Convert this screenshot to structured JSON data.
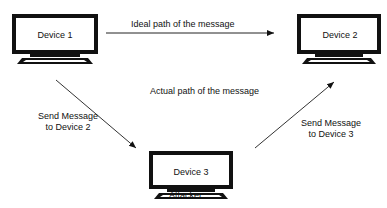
{
  "devices": [
    {
      "label": "Device 1"
    },
    {
      "label": "Device 2"
    },
    {
      "label": "Device 3"
    }
  ],
  "labels": {
    "ideal_path": "Ideal path of the message",
    "actual_path": "Actual path of the message",
    "send_to_device2_line1": "Send Message",
    "send_to_device2_line2": "to Device 2",
    "send_to_device3_line1": "Send Message",
    "send_to_device3_line2": "to Device 3",
    "attacker": "Attacker"
  }
}
